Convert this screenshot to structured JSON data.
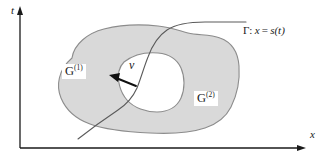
{
  "figure": {
    "background_color": "#ffffff",
    "width": 329,
    "height": 162,
    "axes": {
      "vertical_label": "t",
      "horizontal_label": "x",
      "axis_color": "#1a1a1a",
      "origin_x": 20,
      "origin_y": 148,
      "vertical_top_y": 8,
      "horizontal_right_x": 305
    },
    "regions": [
      {
        "id": "region-1",
        "label": "G",
        "superscript": "(1)",
        "fill_color": "#d9d9d9",
        "stroke_color": "#8c8c8c",
        "label_x": 62,
        "label_y": 64
      },
      {
        "id": "region-2",
        "label": "G",
        "superscript": "(2)",
        "fill_color": "#d9d9d9",
        "stroke_color": "#8c8c8c",
        "label_x": 194,
        "label_y": 91
      }
    ],
    "hole": {
      "id": "inner-hole",
      "fill_color": "#ffffff",
      "stroke_color": "#8c8c8c"
    },
    "curve": {
      "id": "gamma-curve",
      "symbol": "Γ",
      "separator": ":",
      "equation_lhs": "x",
      "equation_eq": "=",
      "equation_rhs": "s",
      "equation_arg": "(t)",
      "label_full": "Γ: x = s(t)",
      "stroke_color": "#5a5a5a"
    },
    "vector": {
      "id": "velocity-vector",
      "label": "v",
      "accent": "⃗",
      "label_full": "v⃗",
      "stroke_color": "#101010",
      "tail_x": 136,
      "tail_y": 86,
      "head_x": 111,
      "head_y": 76
    }
  }
}
